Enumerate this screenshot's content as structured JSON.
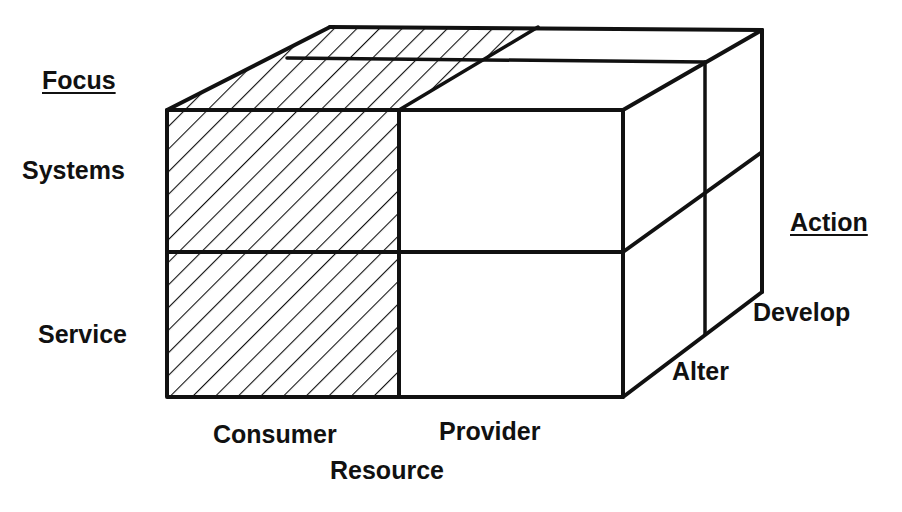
{
  "diagram": {
    "type": "3d-cube-matrix",
    "axes": {
      "focus": {
        "title": "Focus",
        "levels": [
          "Systems",
          "Service"
        ]
      },
      "resource": {
        "title": "Resource",
        "levels": [
          "Consumer",
          "Provider"
        ]
      },
      "action": {
        "title": "Action",
        "levels": [
          "Alter",
          "Develop"
        ]
      }
    },
    "highlighted_column": "Consumer",
    "colors": {
      "stroke": "#111111",
      "hatch": "#111111",
      "background": "#ffffff"
    }
  }
}
